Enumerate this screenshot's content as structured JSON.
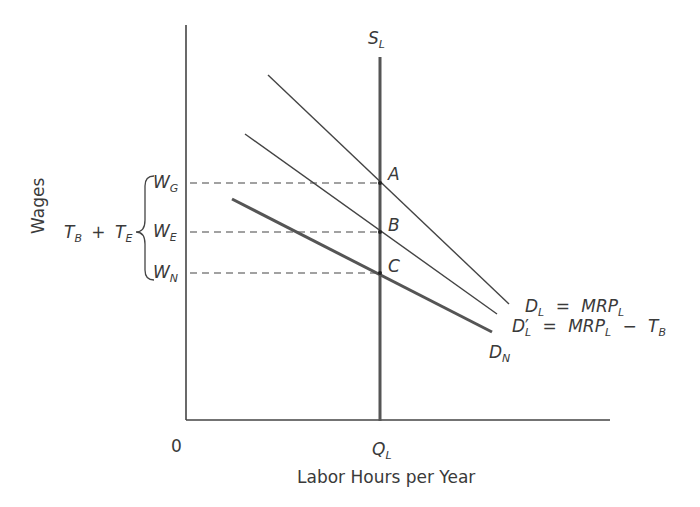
{
  "axes": {
    "y_label": "Wages",
    "x_label": "Labor Hours per Year",
    "origin": "0"
  },
  "supply": {
    "name": "S",
    "sub": "L"
  },
  "quantity": {
    "name": "Q",
    "sub": "L"
  },
  "points": [
    {
      "name": "A"
    },
    {
      "name": "B"
    },
    {
      "name": "C"
    }
  ],
  "wages": [
    {
      "name": "W",
      "sub": "G"
    },
    {
      "name": "W",
      "sub": "E"
    },
    {
      "name": "W",
      "sub": "N"
    }
  ],
  "tax_brace": {
    "t1": "T",
    "t1_sub": "B",
    "plus": "+",
    "t2": "T",
    "t2_sub": "E"
  },
  "curves": {
    "demand": {
      "lhs": "D",
      "lhs_sub": "L",
      "eq": "=",
      "rhs": "MRP",
      "rhs_sub": "L"
    },
    "demand_prime": {
      "lhs": "D",
      "lhs_prime": "′",
      "lhs_sub": "L",
      "eq": "=",
      "rhs": "MRP",
      "rhs_sub": "L",
      "minus": "−",
      "tax": "T",
      "tax_sub": "B"
    },
    "demand_net": {
      "lhs": "D",
      "lhs_sub": "N"
    }
  },
  "colors": {
    "line": "#3a3a3a",
    "axis": "#3a3a3a",
    "dash": "#3a3a3a"
  }
}
